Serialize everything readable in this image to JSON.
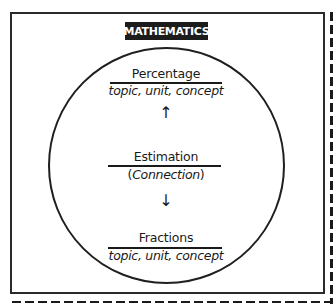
{
  "diagram": {
    "title": "MATHEMATICS",
    "colors": {
      "line": "#1f1f1f",
      "badge_bg": "#1c1c1c",
      "badge_text": "#ffffff",
      "background": "#ffffff"
    },
    "top_node": {
      "title": "Percentage",
      "subtitle": "topic, unit, concept"
    },
    "center_node": {
      "title": "Estimation",
      "subtitle_open": "(",
      "subtitle": "Connection",
      "subtitle_close": ")"
    },
    "bottom_node": {
      "title": "Fractions",
      "subtitle": "topic, unit, concept"
    },
    "arrows": {
      "up": "↑",
      "down": "↓"
    },
    "connections": [
      {
        "from": "Estimation",
        "to": "Percentage",
        "direction": "up"
      },
      {
        "from": "Estimation",
        "to": "Fractions",
        "direction": "down"
      }
    ]
  }
}
